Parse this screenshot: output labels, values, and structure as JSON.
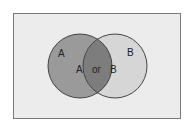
{
  "diagram": {
    "type": "venn",
    "sets": [
      {
        "name": "A",
        "label": "A",
        "inner_label": "A",
        "fill": "#9a9a9a"
      },
      {
        "name": "B",
        "label": "B",
        "inner_label": "B",
        "fill": "#d6d6d6"
      }
    ],
    "intersection": {
      "label": "or",
      "fill": "#7a7a7a"
    },
    "background": "#ececec",
    "stroke": "#444444"
  }
}
